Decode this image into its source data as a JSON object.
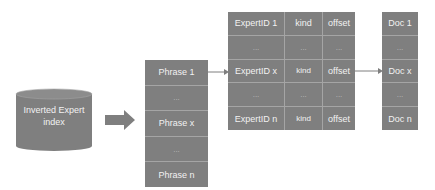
{
  "diagram": {
    "index": {
      "label_line1": "Inverted Expert",
      "label_line2": "index"
    },
    "phrases": [
      "Phrase 1",
      "...",
      "Phrase x",
      "...",
      "Phrase n"
    ],
    "experts": {
      "rows": [
        [
          "ExpertID 1",
          "kind",
          "offset"
        ],
        [
          "...",
          "...",
          "..."
        ],
        [
          "ExpertID x",
          "kind",
          "offset"
        ],
        [
          "...",
          "...",
          "..."
        ],
        [
          "ExpertID n",
          "kind",
          "offset"
        ]
      ]
    },
    "docs": [
      "Doc 1",
      "...",
      "Doc x",
      "...",
      "Doc n"
    ],
    "colors": {
      "fill": "#7f7f7f",
      "text": "#f2f2f2",
      "arrow": "#7f7f7f",
      "divider": "#a5a5a5"
    }
  }
}
